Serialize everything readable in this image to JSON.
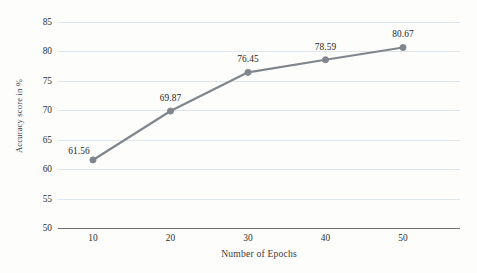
{
  "chart_data": {
    "type": "line",
    "title": "",
    "subtitle": "",
    "xlabel": "Number of Epochs",
    "ylabel": "Accuracy score in %",
    "categories": [
      "10",
      "20",
      "30",
      "40",
      "50"
    ],
    "x": [
      10,
      20,
      30,
      40,
      50
    ],
    "values": [
      61.56,
      69.87,
      76.45,
      78.59,
      80.67
    ],
    "point_labels": [
      "61.56",
      "69.87",
      "76.45",
      "78.59",
      "80.67"
    ],
    "series": [
      {
        "name": "Accuracy",
        "values": [
          61.56,
          69.87,
          76.45,
          78.59,
          80.67
        ]
      }
    ],
    "ylim": [
      50,
      85
    ],
    "yticks": [
      50,
      55,
      60,
      65,
      70,
      75,
      80,
      85
    ],
    "ytick_labels": [
      "50",
      "55",
      "60",
      "65",
      "70",
      "75",
      "80",
      "85"
    ],
    "xtick_labels": [
      "10",
      "20",
      "30",
      "40",
      "50"
    ],
    "grid": "horizontal",
    "legend": "none",
    "colors": {
      "line": "#7f868c",
      "marker": "#7f868c",
      "gridline": "#dfe6ea",
      "axis": "#6f6f6f",
      "text": "#2e2e2e",
      "background": "#fdfdfc"
    },
    "marker": "circle",
    "line_width": 2.2
  }
}
